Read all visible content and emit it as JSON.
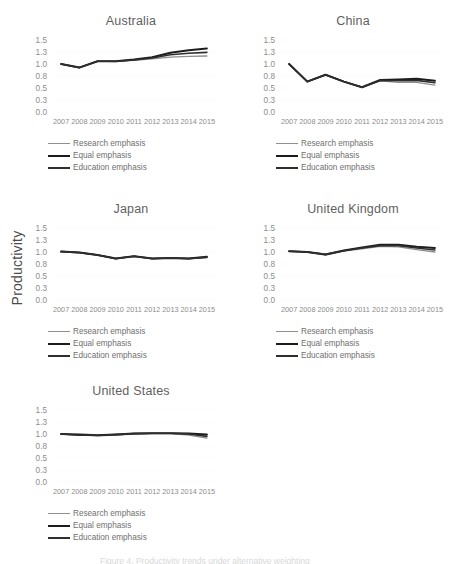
{
  "figure": {
    "y_axis_title": "Productivity",
    "background": "#ffffff",
    "series_colors": {
      "research": "#8f8f8f",
      "equal": "#1c1c1c",
      "education": "#2e2e2e"
    },
    "legend_labels": {
      "research": "Research emphasis",
      "equal": "Equal emphasis",
      "education": "Education emphasis"
    },
    "partial_caption": "Figure 4. Productivity trends under alternative weighting"
  },
  "chart_data": [
    {
      "type": "line",
      "title": "Australia",
      "xlabel": "",
      "ylabel": "Productivity",
      "x": [
        2007,
        2008,
        2009,
        2010,
        2011,
        2012,
        2013,
        2014,
        2015
      ],
      "ytick_labels": [
        "1.5",
        "1.3",
        "1.0",
        "0.8",
        "0.5",
        "0.3",
        "0.0"
      ],
      "ytick_values": [
        1.5,
        1.3,
        1.0,
        0.8,
        0.5,
        0.3,
        0.0
      ],
      "ylim": [
        0.0,
        1.5
      ],
      "grid": true,
      "legend_position": "bottom",
      "series": [
        {
          "name": "Research emphasis",
          "values": [
            1.0,
            0.94,
            1.07,
            1.06,
            1.09,
            1.13,
            1.17,
            1.19,
            1.2
          ]
        },
        {
          "name": "Equal emphasis",
          "values": [
            1.0,
            0.94,
            1.07,
            1.07,
            1.11,
            1.17,
            1.28,
            1.33,
            1.36
          ]
        },
        {
          "name": "Education emphasis",
          "values": [
            1.0,
            0.94,
            1.07,
            1.07,
            1.1,
            1.15,
            1.23,
            1.27,
            1.29
          ]
        }
      ]
    },
    {
      "type": "line",
      "title": "China",
      "xlabel": "",
      "ylabel": "Productivity",
      "x": [
        2007,
        2008,
        2009,
        2010,
        2011,
        2012,
        2013,
        2014,
        2015
      ],
      "ytick_labels": [
        "1.5",
        "1.3",
        "1.0",
        "0.8",
        "0.5",
        "0.3",
        "0.0"
      ],
      "ytick_values": [
        1.5,
        1.3,
        1.0,
        0.8,
        0.5,
        0.3,
        0.0
      ],
      "ylim": [
        0.0,
        1.5
      ],
      "grid": true,
      "legend_position": "bottom",
      "series": [
        {
          "name": "Research emphasis",
          "values": [
            1.0,
            0.66,
            0.82,
            0.66,
            0.52,
            0.68,
            0.64,
            0.64,
            0.57
          ]
        },
        {
          "name": "Equal emphasis",
          "values": [
            1.0,
            0.66,
            0.82,
            0.66,
            0.52,
            0.7,
            0.71,
            0.73,
            0.68
          ]
        },
        {
          "name": "Education emphasis",
          "values": [
            1.0,
            0.66,
            0.82,
            0.66,
            0.52,
            0.69,
            0.68,
            0.69,
            0.63
          ]
        }
      ]
    },
    {
      "type": "line",
      "title": "Japan",
      "xlabel": "",
      "ylabel": "Productivity",
      "x": [
        2007,
        2008,
        2009,
        2010,
        2011,
        2012,
        2013,
        2014,
        2015
      ],
      "ytick_labels": [
        "1.5",
        "1.3",
        "1.0",
        "0.8",
        "0.5",
        "0.3",
        "0.0"
      ],
      "ytick_values": [
        1.5,
        1.3,
        1.0,
        0.8,
        0.5,
        0.3,
        0.0
      ],
      "ylim": [
        0.0,
        1.5
      ],
      "grid": true,
      "legend_position": "bottom",
      "series": [
        {
          "name": "Research emphasis",
          "values": [
            1.01,
            0.99,
            0.95,
            0.89,
            0.93,
            0.89,
            0.9,
            0.89,
            0.91
          ]
        },
        {
          "name": "Equal emphasis",
          "values": [
            1.01,
            0.99,
            0.95,
            0.89,
            0.93,
            0.89,
            0.9,
            0.89,
            0.92
          ]
        },
        {
          "name": "Education emphasis",
          "values": [
            1.01,
            0.99,
            0.95,
            0.89,
            0.93,
            0.89,
            0.9,
            0.89,
            0.91
          ]
        }
      ]
    },
    {
      "type": "line",
      "title": "United Kingdom",
      "xlabel": "",
      "ylabel": "Productivity",
      "x": [
        2007,
        2008,
        2009,
        2010,
        2011,
        2012,
        2013,
        2014,
        2015
      ],
      "ytick_labels": [
        "1.5",
        "1.3",
        "1.0",
        "0.8",
        "0.5",
        "0.3",
        "0.0"
      ],
      "ytick_values": [
        1.5,
        1.3,
        1.0,
        0.8,
        0.5,
        0.3,
        0.0
      ],
      "ylim": [
        0.0,
        1.5
      ],
      "grid": true,
      "legend_position": "bottom",
      "series": [
        {
          "name": "Research emphasis",
          "values": [
            1.02,
            1.0,
            0.95,
            1.02,
            1.08,
            1.14,
            1.13,
            1.06,
            1.0
          ]
        },
        {
          "name": "Equal emphasis",
          "values": [
            1.02,
            1.0,
            0.96,
            1.04,
            1.11,
            1.18,
            1.18,
            1.13,
            1.1
          ]
        },
        {
          "name": "Education emphasis",
          "values": [
            1.02,
            1.0,
            0.96,
            1.03,
            1.1,
            1.16,
            1.16,
            1.1,
            1.05
          ]
        }
      ]
    },
    {
      "type": "line",
      "title": "United States",
      "xlabel": "",
      "ylabel": "Productivity",
      "x": [
        2007,
        2008,
        2009,
        2010,
        2011,
        2012,
        2013,
        2014,
        2015
      ],
      "ytick_labels": [
        "1.5",
        "1.3",
        "1.0",
        "0.8",
        "0.5",
        "0.3",
        "0.0"
      ],
      "ytick_values": [
        1.5,
        1.3,
        1.0,
        0.8,
        0.5,
        0.3,
        0.0
      ],
      "ylim": [
        0.0,
        1.5
      ],
      "grid": true,
      "legend_position": "bottom",
      "series": [
        {
          "name": "Research emphasis",
          "values": [
            1.0,
            0.98,
            0.97,
            0.98,
            1.0,
            1.01,
            1.01,
            0.98,
            0.93
          ]
        },
        {
          "name": "Equal emphasis",
          "values": [
            1.0,
            0.99,
            0.98,
            0.99,
            1.01,
            1.02,
            1.02,
            1.01,
            0.99
          ]
        },
        {
          "name": "Education emphasis",
          "values": [
            1.0,
            0.98,
            0.98,
            0.99,
            1.01,
            1.02,
            1.02,
            1.0,
            0.96
          ]
        }
      ]
    }
  ],
  "panels": [
    {
      "id": "australia",
      "left": 22,
      "top": 12,
      "width": 218
    },
    {
      "id": "china",
      "left": 250,
      "top": 12,
      "width": 206
    },
    {
      "id": "japan",
      "left": 22,
      "top": 200,
      "width": 218
    },
    {
      "id": "united-kingdom",
      "left": 250,
      "top": 200,
      "width": 206
    },
    {
      "id": "united-states",
      "left": 22,
      "top": 382,
      "width": 218
    }
  ]
}
